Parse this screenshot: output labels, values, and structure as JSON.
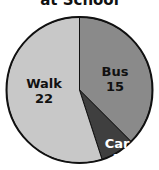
{
  "chart_data": {
    "type": "pie",
    "title": "at School",
    "categories": [
      "Bus",
      "Car",
      "Walk"
    ],
    "values": [
      15,
      3,
      22
    ],
    "colors": [
      "#8a8a8a",
      "#3f3f3f",
      "#c8c8c8"
    ],
    "label_colors": [
      "#111111",
      "#ffffff",
      "#111111"
    ],
    "start_angle_deg": 0,
    "direction": "clockwise",
    "legend": "none"
  }
}
